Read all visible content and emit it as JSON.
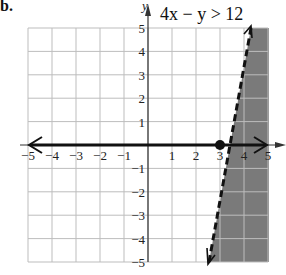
{
  "problem_marker": "b.",
  "chart_data": {
    "type": "line",
    "title": "4x − y > 12",
    "xlabel": "x",
    "ylabel": "y",
    "xlim": [
      -5,
      5
    ],
    "ylim": [
      -5,
      5
    ],
    "grid": true,
    "x_ticks": [
      "−5",
      "−4",
      "−3",
      "−2",
      "−1",
      "1",
      "2",
      "3",
      "4",
      "5"
    ],
    "y_ticks": [
      "5",
      "4",
      "3",
      "2",
      "1",
      "−1",
      "−2",
      "−3",
      "−4",
      "−5"
    ],
    "boundary": {
      "equation": "y = 4x − 12",
      "style": "dashed",
      "points": [
        [
          1.75,
          -5
        ],
        [
          4.25,
          5
        ]
      ]
    },
    "shaded_region": "right of boundary (y < 4x − 12)",
    "number_line": {
      "from": -5,
      "to": 5,
      "highlight_point": 3,
      "arrow": "both"
    },
    "marked_point": [
      3,
      0
    ],
    "colors": {
      "shade": "#7a7a7a",
      "grid": "#bdbdbd",
      "line": "#111111"
    }
  }
}
